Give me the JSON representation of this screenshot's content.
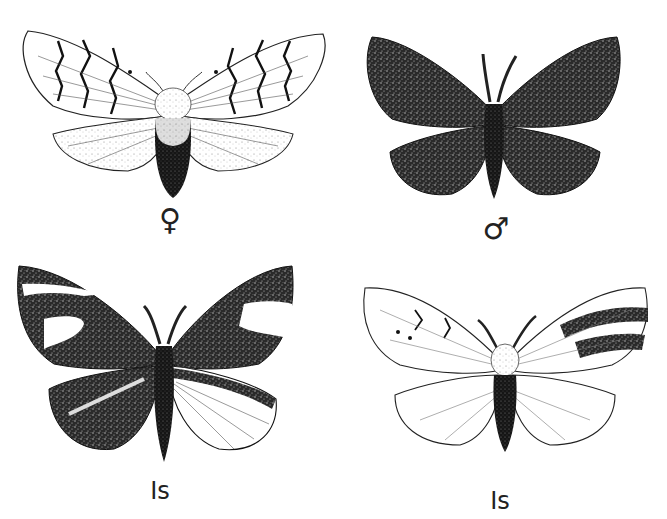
{
  "figure": {
    "background": "#ffffff",
    "ink_color": "#1a1a1a",
    "panels": [
      {
        "id": "female",
        "label": "♀",
        "description": "pale moth with dark zigzag cross-bands on forewings, dark abdomen"
      },
      {
        "id": "male",
        "label": "♂",
        "description": "uniformly dark stippled moth with feathered antennae"
      },
      {
        "id": "intersex-1",
        "label": "Is",
        "description": "mostly dark mottled moth with pale patches, right hindwing pale"
      },
      {
        "id": "intersex-2",
        "label": "Is",
        "description": "pale moth with dark bands on right forewing, dark abdomen"
      }
    ]
  }
}
